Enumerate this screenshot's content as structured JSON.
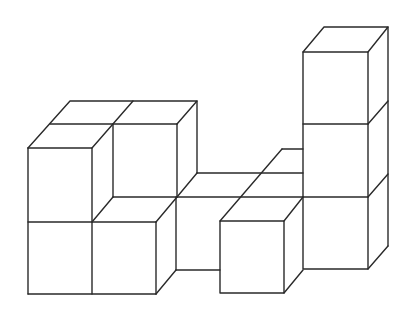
{
  "diagram": {
    "title": "Isometric cube structure",
    "stroke_color": "#2a2a2a",
    "background": "#ffffff",
    "cube_count_visible": 11
  }
}
